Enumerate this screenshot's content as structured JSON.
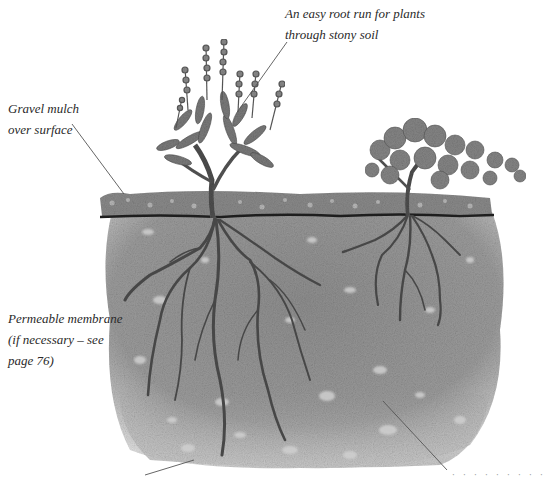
{
  "figure": {
    "type": "garden-cross-section-illustration",
    "style": "grayscale pencil drawing"
  },
  "annotations": {
    "root_run": {
      "lines": [
        "An easy root run for plants",
        "through stony soil"
      ]
    },
    "gravel_mulch": {
      "lines": [
        "Gravel mulch",
        "over surface"
      ]
    },
    "membrane": {
      "lines": [
        "Permeable membrane",
        "(if necessary – see",
        "page 76)"
      ]
    },
    "bottom_right_partial": {
      "text": "· · · · · · · · ·"
    }
  },
  "colors": {
    "background": "#ffffff",
    "soil": "#8e8e8e",
    "soil_light": "#b9b9b9",
    "gravel_band": "#7a7a7a",
    "membrane_line": "#1e1e1e",
    "roots": "#4a4a4a",
    "foliage": "#6a6a6a",
    "leader_line": "#555555",
    "text": "#2a2a2a"
  }
}
